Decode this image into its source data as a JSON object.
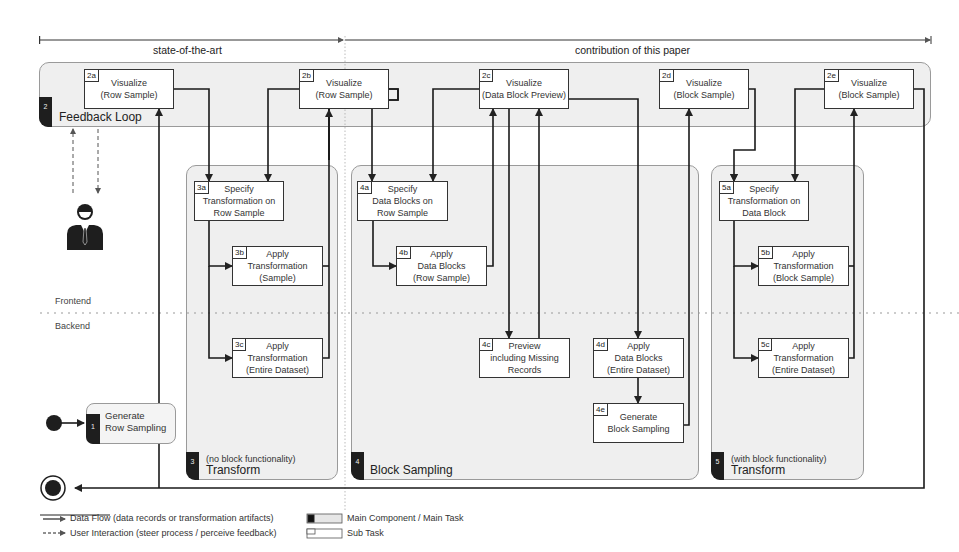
{
  "header": {
    "left_span": "state-of-the-art",
    "right_span": "contribution of this paper"
  },
  "lanes": {
    "frontend": "Frontend",
    "backend": "Backend"
  },
  "regions": {
    "feedback": {
      "number": "2",
      "title": "Feedback Loop"
    },
    "transform_no_block": {
      "number": "3",
      "subtitle": "(no block functionality)",
      "title": "Transform"
    },
    "block_sampling": {
      "number": "4",
      "title": "Block Sampling"
    },
    "transform_with_block": {
      "number": "5",
      "subtitle": "(with block functionality)",
      "title": "Transform"
    }
  },
  "generate_row_sampling": {
    "number": "1",
    "label": "Generate\nRow Sampling"
  },
  "tasks": {
    "t2a": {
      "id": "2a",
      "label": "Visualize\n(Row Sample)"
    },
    "t2b": {
      "id": "2b",
      "label": "Visualize\n(Row Sample)"
    },
    "t2c": {
      "id": "2c",
      "label": "Visualize\n(Data Block Preview)"
    },
    "t2d": {
      "id": "2d",
      "label": "Visualize\n(Block Sample)"
    },
    "t2e": {
      "id": "2e",
      "label": "Visualize\n(Block Sample)"
    },
    "t3a": {
      "id": "3a",
      "label": "Specify\nTransformation on\nRow Sample"
    },
    "t3b": {
      "id": "3b",
      "label": "Apply\nTransformation\n(Sample)"
    },
    "t3c": {
      "id": "3c",
      "label": "Apply\nTransformation\n(Entire Dataset)"
    },
    "t4a": {
      "id": "4a",
      "label": "Specify\nData Blocks on\nRow Sample"
    },
    "t4b": {
      "id": "4b",
      "label": "Apply\nData Blocks\n(Row Sample)"
    },
    "t4c": {
      "id": "4c",
      "label": "Preview\nincluding Missing\nRecords"
    },
    "t4d": {
      "id": "4d",
      "label": "Apply\nData Blocks\n(Entire Dataset)"
    },
    "t4e": {
      "id": "4e",
      "label": "Generate\nBlock Sampling"
    },
    "t5a": {
      "id": "5a",
      "label": "Specify\nTransformation on\nData Block"
    },
    "t5b": {
      "id": "5b",
      "label": "Apply\nTransformation\n(Block Sample)"
    },
    "t5c": {
      "id": "5c",
      "label": "Apply\nTransformation\n(Entire Dataset)"
    }
  },
  "legend": {
    "data_flow": "Data Flow (data records or transformation artifacts)",
    "user_interaction": "User Interaction (steer process / perceive feedback)",
    "main_component": "Main Component / Main Task",
    "sub_task": "Sub Task"
  }
}
